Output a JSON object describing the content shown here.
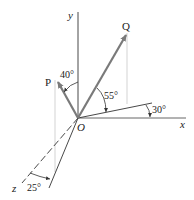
{
  "diagram": {
    "type": "3d-force-vectors",
    "origin_label": "O",
    "axes": [
      {
        "name": "x",
        "label": "x"
      },
      {
        "name": "y",
        "label": "y"
      },
      {
        "name": "z",
        "label": "z"
      }
    ],
    "vectors": [
      {
        "name": "P",
        "label": "P",
        "angle_label": "40°",
        "angle_ref": "from y axis"
      },
      {
        "name": "Q",
        "label": "Q",
        "angle_label": "55°",
        "angle_ref": "above projection plane line"
      }
    ],
    "angles": {
      "p_from_y": "40°",
      "q_elevation": "55°",
      "plane_from_x": "30°",
      "p_plane_from_z": "25°"
    },
    "colors": {
      "vector": "#7a7a7a",
      "axis": "#333333",
      "projection": "#bdbdbd"
    }
  }
}
